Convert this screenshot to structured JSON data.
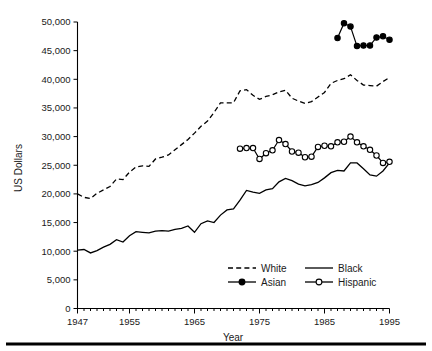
{
  "chart_data": {
    "type": "line",
    "title": "",
    "xlabel": "Year",
    "ylabel": "US Dollars",
    "xlim": [
      1947,
      1995
    ],
    "ylim": [
      0,
      50000
    ],
    "grid": false,
    "legend_position": "bottom-center",
    "y_ticks": [
      0,
      5000,
      10000,
      15000,
      20000,
      25000,
      30000,
      35000,
      40000,
      45000,
      50000
    ],
    "y_tick_labels": [
      "0",
      "5,000",
      "10,000",
      "15,000",
      "20,000",
      "25,000",
      "30,000",
      "35,000",
      "40,000",
      "45,000",
      "50,000"
    ],
    "x_ticks": [
      1947,
      1955,
      1965,
      1975,
      1985,
      1995
    ],
    "x_tick_labels": [
      "1947",
      "1955",
      "1965",
      "1975",
      "1985",
      "1995"
    ],
    "x_minor_tick_interval": 1,
    "series": [
      {
        "name": "White",
        "style": "dashed",
        "marker": "none",
        "color": "#000000",
        "x": [
          1947,
          1948,
          1949,
          1950,
          1951,
          1952,
          1953,
          1954,
          1955,
          1956,
          1957,
          1958,
          1959,
          1960,
          1961,
          1962,
          1963,
          1964,
          1965,
          1966,
          1967,
          1968,
          1969,
          1970,
          1971,
          1972,
          1973,
          1974,
          1975,
          1976,
          1977,
          1978,
          1979,
          1980,
          1981,
          1982,
          1983,
          1984,
          1985,
          1986,
          1987,
          1988,
          1989,
          1990,
          1991,
          1992,
          1993,
          1994,
          1995
        ],
        "y": [
          20000,
          19400,
          19200,
          20100,
          20700,
          21300,
          22600,
          22500,
          23800,
          24700,
          24900,
          24800,
          26100,
          26400,
          26800,
          27700,
          28600,
          29500,
          30600,
          31800,
          32700,
          34200,
          35900,
          35900,
          35900,
          38000,
          38200,
          37200,
          36500,
          37000,
          37300,
          37800,
          38100,
          36700,
          36200,
          35800,
          36100,
          36900,
          37700,
          39300,
          39800,
          40100,
          40800,
          39800,
          39000,
          38900,
          38800,
          39600,
          40300
        ]
      },
      {
        "name": "Black",
        "style": "solid",
        "marker": "none",
        "color": "#000000",
        "x": [
          1947,
          1948,
          1949,
          1950,
          1951,
          1952,
          1953,
          1954,
          1955,
          1956,
          1957,
          1958,
          1959,
          1960,
          1961,
          1962,
          1963,
          1964,
          1965,
          1966,
          1967,
          1968,
          1969,
          1970,
          1971,
          1972,
          1973,
          1974,
          1975,
          1976,
          1977,
          1978,
          1979,
          1980,
          1981,
          1982,
          1983,
          1984,
          1985,
          1986,
          1987,
          1988,
          1989,
          1990,
          1991,
          1992,
          1993,
          1994,
          1995
        ],
        "y": [
          10200,
          10300,
          9700,
          10100,
          10700,
          11200,
          12000,
          11600,
          12700,
          13400,
          13300,
          13200,
          13500,
          13600,
          13500,
          13800,
          14000,
          14400,
          13300,
          14800,
          15300,
          15000,
          16300,
          17200,
          17400,
          18900,
          20600,
          20300,
          20100,
          20700,
          20900,
          22100,
          22700,
          22300,
          21700,
          21400,
          21600,
          22000,
          22800,
          23700,
          24100,
          24000,
          25400,
          25400,
          24400,
          23300,
          23100,
          24000,
          25400
        ]
      },
      {
        "name": "Hispanic",
        "style": "solid",
        "marker": "open-circle",
        "color": "#000000",
        "x": [
          1972,
          1973,
          1974,
          1975,
          1976,
          1977,
          1978,
          1979,
          1980,
          1981,
          1982,
          1983,
          1984,
          1985,
          1986,
          1987,
          1988,
          1989,
          1990,
          1991,
          1992,
          1993,
          1994,
          1995
        ],
        "y": [
          27900,
          28000,
          28000,
          26100,
          27100,
          27600,
          29400,
          28700,
          27400,
          27200,
          26400,
          26500,
          28200,
          28400,
          28300,
          29000,
          29100,
          30000,
          29000,
          28300,
          27700,
          26700,
          25400,
          25600
        ]
      },
      {
        "name": "Asian",
        "style": "solid",
        "marker": "filled-circle",
        "color": "#000000",
        "x": [
          1987,
          1988,
          1989,
          1990,
          1991,
          1992,
          1993,
          1994,
          1995
        ],
        "y": [
          47200,
          49800,
          49200,
          45800,
          45900,
          45900,
          47300,
          47500,
          46900
        ]
      }
    ]
  },
  "legend": {
    "entries": [
      {
        "label": "White",
        "style": "dashed",
        "marker": "none"
      },
      {
        "label": "Black",
        "style": "solid",
        "marker": "none"
      },
      {
        "label": "Asian",
        "style": "solid",
        "marker": "filled-circle"
      },
      {
        "label": "Hispanic",
        "style": "solid",
        "marker": "open-circle"
      }
    ]
  }
}
